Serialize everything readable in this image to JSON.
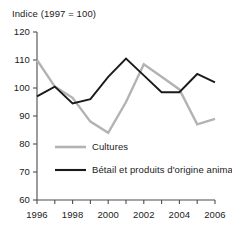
{
  "chart_data": {
    "type": "line",
    "title": "Indice (1997 = 100)",
    "xlabel": "",
    "ylabel": "",
    "x": [
      1996,
      1997,
      1998,
      1999,
      2000,
      2001,
      2002,
      2003,
      2004,
      2005,
      2006
    ],
    "xtick_labels": [
      "1996",
      "1998",
      "2000",
      "2002",
      "2004",
      "2006"
    ],
    "xticks": [
      1996,
      1998,
      2000,
      2002,
      2004,
      2006
    ],
    "xlim": [
      1996,
      2006
    ],
    "ytick_labels": [
      "120",
      "110",
      "100",
      "90",
      "80",
      "70",
      "60"
    ],
    "yticks": [
      120,
      110,
      100,
      90,
      80,
      70,
      60
    ],
    "ylim": [
      60,
      120
    ],
    "grid": false,
    "legend_position": "inside-lower-left",
    "series": [
      {
        "name": "Cultures",
        "color": "#b3b3b3",
        "values": [
          110.0,
          100.5,
          96.5,
          88.0,
          84.0,
          95.0,
          108.5,
          104.0,
          99.5,
          87.0,
          89.0
        ]
      },
      {
        "name": "Bétail et produits d'origine animale",
        "color": "#1a1a1a",
        "values": [
          97.0,
          100.5,
          94.5,
          96.0,
          104.0,
          110.5,
          104.5,
          98.5,
          98.5,
          105.0,
          102.0
        ]
      }
    ]
  },
  "legend": {
    "items": [
      {
        "label": "Cultures",
        "color": "#b3b3b3"
      },
      {
        "label": "Bétail et produits d'origine animale",
        "color": "#1a1a1a"
      }
    ]
  }
}
